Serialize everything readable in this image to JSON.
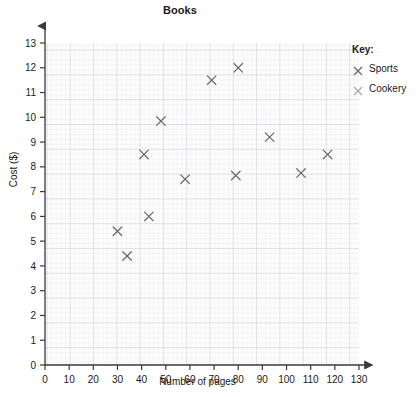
{
  "chart": {
    "title": "Books",
    "xlabel": "Number of pages",
    "ylabel": "Cost ($)"
  },
  "legend": {
    "title": "Key:",
    "entries": [
      {
        "label": "Sports",
        "marker": "x-marker-icon",
        "color": "#6b6b6b"
      },
      {
        "label": "Cookery",
        "marker": "x-marker-icon",
        "color": "#a8a8a8"
      }
    ]
  },
  "axes": {
    "x_ticks": [
      "0",
      "10",
      "20",
      "30",
      "40",
      "50",
      "60",
      "70",
      "80",
      "90",
      "100",
      "110",
      "120",
      "130"
    ],
    "y_ticks": [
      "0",
      "1",
      "2",
      "3",
      "4",
      "5",
      "6",
      "7",
      "8",
      "9",
      "10",
      "11",
      "12",
      "13"
    ]
  },
  "chart_data": {
    "type": "scatter",
    "title": "Books",
    "xlabel": "Number of pages",
    "ylabel": "Cost ($)",
    "xlim": [
      0,
      130
    ],
    "ylim": [
      0,
      13
    ],
    "grid": true,
    "legend_position": "right",
    "series": [
      {
        "name": "Sports",
        "color": "#6b6b6b",
        "points": [
          {
            "x": 30,
            "y": 5.4
          },
          {
            "x": 34,
            "y": 4.4
          },
          {
            "x": 43,
            "y": 6.0
          },
          {
            "x": 41,
            "y": 8.5
          },
          {
            "x": 48,
            "y": 9.85
          },
          {
            "x": 58,
            "y": 7.5
          },
          {
            "x": 69,
            "y": 11.5
          },
          {
            "x": 80,
            "y": 12.0
          },
          {
            "x": 79,
            "y": 7.65
          },
          {
            "x": 93,
            "y": 9.2
          },
          {
            "x": 106,
            "y": 7.75
          },
          {
            "x": 117,
            "y": 8.5
          }
        ]
      }
    ]
  }
}
